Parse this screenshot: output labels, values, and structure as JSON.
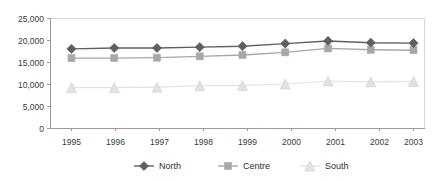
{
  "chart_data": {
    "type": "line",
    "title": "",
    "subtitle": "",
    "xlabel": "",
    "ylabel": "",
    "categories": [
      "1995",
      "1996",
      "1997",
      "1998",
      "1999",
      "2000",
      "2001",
      "2002",
      "2003"
    ],
    "x": [
      1995,
      1996,
      1997,
      1998,
      1999,
      2000,
      2001,
      2002,
      2003
    ],
    "series": [
      {
        "name": "North",
        "marker": "diamond",
        "color": "#5f5f5f",
        "values": [
          18100,
          18300,
          18300,
          18500,
          18700,
          19300,
          19900,
          19500,
          19400
        ]
      },
      {
        "name": "Centre",
        "marker": "square",
        "color": "#a8a8a8",
        "values": [
          16000,
          16000,
          16100,
          16400,
          16700,
          17300,
          18200,
          17900,
          17800
        ]
      },
      {
        "name": "South",
        "marker": "triangle",
        "color": "#e2e2e2",
        "values": [
          9300,
          9300,
          9400,
          9700,
          9800,
          10100,
          10800,
          10600,
          10700
        ]
      }
    ],
    "ylim": [
      0,
      25000
    ],
    "yticks": [
      0,
      5000,
      10000,
      15000,
      20000,
      25000
    ],
    "ytick_labels": [
      "0",
      "5,000",
      "10,000",
      "15,000",
      "20,000",
      "25,000"
    ],
    "grid": false,
    "legend_position": "bottom",
    "legend_entries": [
      "North",
      "Centre",
      "South"
    ]
  },
  "axes": {
    "y_tick_labels": [
      "25,000",
      "20,000",
      "15,000",
      "10,000",
      "5,000",
      "0"
    ],
    "x_tick_labels": [
      "1995",
      "1996",
      "1997",
      "1998",
      "1999",
      "2000",
      "2001",
      "2002",
      "2003"
    ]
  },
  "legend": {
    "items": [
      {
        "label": "North",
        "color": "#5f5f5f",
        "marker": "diamond"
      },
      {
        "label": "Centre",
        "color": "#a8a8a8",
        "marker": "square"
      },
      {
        "label": "South",
        "color": "#e2e2e2",
        "marker": "triangle"
      }
    ]
  },
  "colors": {
    "north": "#5f5f5f",
    "centre": "#a8a8a8",
    "south": "#e2e2e2",
    "axis": "#9a9a9a",
    "frame": "#d8d8d8",
    "text": "#3a3a3a",
    "background": "#ffffff"
  }
}
